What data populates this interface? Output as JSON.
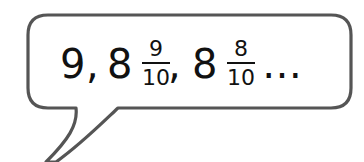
{
  "speech_bubble": {
    "border_color": "#555555",
    "fill_color": "#ffffff",
    "sequence": {
      "term1": {
        "whole": "9",
        "separator": ","
      },
      "term2": {
        "whole": "8",
        "numerator": "9",
        "denominator": "10",
        "separator": ","
      },
      "term3": {
        "whole": "8",
        "numerator": "8",
        "denominator": "10"
      },
      "ellipsis": "…"
    }
  }
}
